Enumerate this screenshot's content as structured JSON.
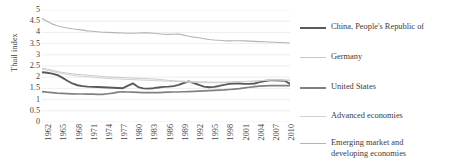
{
  "chart_data": {
    "type": "line",
    "title": "",
    "xlabel": "",
    "ylabel": "Thail index",
    "ylim": [
      0,
      5
    ],
    "ytick_labels": [
      "0",
      "0.5",
      "1",
      "1.5",
      "2",
      "2.5",
      "3",
      "3.5",
      "4",
      "4.5",
      "5"
    ],
    "ytick_values": [
      0,
      0.5,
      1,
      1.5,
      2,
      2.5,
      3,
      3.5,
      4,
      4.5,
      5
    ],
    "grid": true,
    "legend_position": "right",
    "x_start": 1962,
    "x_end": 2011,
    "xtick_labels": [
      "1962",
      "1965",
      "1968",
      "1971",
      "1974",
      "1977",
      "1980",
      "1983",
      "1986",
      "1989",
      "1992",
      "1995",
      "1998",
      "2001",
      "2004",
      "2007",
      "2010"
    ],
    "xtick_values": [
      1962,
      1965,
      1968,
      1971,
      1974,
      1977,
      1980,
      1983,
      1986,
      1989,
      1992,
      1995,
      1998,
      2001,
      2004,
      2007,
      2010
    ],
    "x": [
      1962,
      1963,
      1964,
      1965,
      1966,
      1967,
      1968,
      1969,
      1970,
      1971,
      1972,
      1973,
      1974,
      1975,
      1976,
      1977,
      1978,
      1979,
      1980,
      1981,
      1982,
      1983,
      1984,
      1985,
      1986,
      1987,
      1988,
      1989,
      1990,
      1991,
      1992,
      1993,
      1994,
      1995,
      1996,
      1997,
      1998,
      1999,
      2000,
      2001,
      2002,
      2003,
      2004,
      2005,
      2006,
      2007,
      2008,
      2009,
      2010,
      2011
    ],
    "series": [
      {
        "name": "China, People's Republic of",
        "color": "#5a5a5a",
        "width": 1.9,
        "values": [
          2.22,
          2.2,
          2.16,
          2.1,
          1.98,
          1.84,
          1.72,
          1.64,
          1.6,
          1.58,
          1.57,
          1.56,
          1.55,
          1.54,
          1.53,
          1.52,
          1.51,
          1.62,
          1.72,
          1.56,
          1.5,
          1.49,
          1.51,
          1.54,
          1.57,
          1.58,
          1.6,
          1.66,
          1.74,
          1.81,
          1.74,
          1.66,
          1.58,
          1.55,
          1.57,
          1.61,
          1.66,
          1.7,
          1.72,
          1.72,
          1.7,
          1.7,
          1.72,
          1.78,
          1.83,
          1.86,
          1.86,
          1.85,
          1.84,
          1.7
        ]
      },
      {
        "name": "Germany",
        "color": "#c9c9c9",
        "width": 1.0,
        "values": [
          2.4,
          2.36,
          2.31,
          2.26,
          2.21,
          2.18,
          2.15,
          2.13,
          2.11,
          2.09,
          2.07,
          2.05,
          2.03,
          2.01,
          2.0,
          1.99,
          1.98,
          1.97,
          1.96,
          1.95,
          1.94,
          1.93,
          1.92,
          1.9,
          1.88,
          1.86,
          1.84,
          1.83,
          1.82,
          1.81,
          1.8,
          1.79,
          1.79,
          1.78,
          1.78,
          1.78,
          1.78,
          1.79,
          1.8,
          1.81,
          1.81,
          1.82,
          1.83,
          1.84,
          1.86,
          1.88,
          1.88,
          1.87,
          1.86,
          1.84
        ]
      },
      {
        "name": "United States",
        "color": "#808080",
        "width": 1.7,
        "values": [
          1.36,
          1.33,
          1.31,
          1.29,
          1.28,
          1.27,
          1.26,
          1.25,
          1.25,
          1.24,
          1.24,
          1.23,
          1.23,
          1.26,
          1.29,
          1.33,
          1.35,
          1.34,
          1.33,
          1.32,
          1.31,
          1.31,
          1.31,
          1.31,
          1.32,
          1.33,
          1.34,
          1.34,
          1.35,
          1.36,
          1.37,
          1.38,
          1.39,
          1.4,
          1.41,
          1.42,
          1.43,
          1.45,
          1.47,
          1.49,
          1.52,
          1.55,
          1.58,
          1.6,
          1.61,
          1.62,
          1.62,
          1.62,
          1.62,
          1.62
        ]
      },
      {
        "name": "Advanced economies",
        "color": "#d2d2d2",
        "width": 1.0,
        "values": [
          2.36,
          2.31,
          2.26,
          2.21,
          2.16,
          2.12,
          2.09,
          2.06,
          2.04,
          2.02,
          2.0,
          1.98,
          1.96,
          1.94,
          1.93,
          1.92,
          1.91,
          1.9,
          1.89,
          1.88,
          1.87,
          1.86,
          1.85,
          1.84,
          1.83,
          1.82,
          1.81,
          1.8,
          1.79,
          1.78,
          1.77,
          1.76,
          1.76,
          1.75,
          1.75,
          1.75,
          1.76,
          1.77,
          1.78,
          1.79,
          1.8,
          1.81,
          1.82,
          1.84,
          1.86,
          1.87,
          1.88,
          1.88,
          1.88,
          1.88
        ]
      },
      {
        "name": "Emerging market and\ndeveloping economies",
        "color": "#b4b4b4",
        "width": 1.1,
        "values": [
          4.62,
          4.5,
          4.38,
          4.3,
          4.24,
          4.2,
          4.16,
          4.13,
          4.1,
          4.07,
          4.05,
          4.03,
          4.01,
          4.0,
          3.99,
          3.98,
          3.97,
          3.96,
          3.96,
          3.97,
          3.98,
          3.98,
          3.96,
          3.94,
          3.92,
          3.91,
          3.92,
          3.93,
          3.88,
          3.83,
          3.79,
          3.76,
          3.72,
          3.68,
          3.66,
          3.65,
          3.63,
          3.62,
          3.63,
          3.63,
          3.62,
          3.61,
          3.6,
          3.59,
          3.58,
          3.57,
          3.56,
          3.55,
          3.54,
          3.53
        ]
      }
    ]
  },
  "legend": {
    "items": [
      {
        "label": "China, People's Republic of",
        "color": "#5a5a5a",
        "width": 2.1,
        "top": 14
      },
      {
        "label": "Germany",
        "color": "#c9c9c9",
        "width": 1.2,
        "top": 44
      },
      {
        "label": "United States",
        "color": "#808080",
        "width": 2.0,
        "top": 74
      },
      {
        "label": "Advanced economies",
        "color": "#d2d2d2",
        "width": 1.2,
        "top": 103
      },
      {
        "label": "Emerging market and\ndeveloping economies",
        "color": "#b4b4b4",
        "width": 1.3,
        "top": 130
      }
    ]
  },
  "colors": {
    "gridline": "#e8e8e8",
    "axis_text": "#3f3f3f",
    "background": "#ffffff"
  }
}
